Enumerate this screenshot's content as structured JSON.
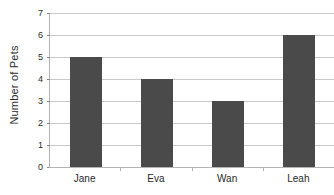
{
  "chart_data": {
    "type": "bar",
    "title": "",
    "xlabel": "",
    "ylabel": "Number of Pets",
    "categories": [
      "Jane",
      "Eva",
      "Wan",
      "Leah"
    ],
    "values": [
      5,
      4,
      3,
      6
    ],
    "ylim": [
      0,
      7
    ],
    "yticks": [
      0,
      1,
      2,
      3,
      4,
      5,
      6,
      7
    ],
    "ytick_labels": [
      "0",
      "1",
      "2",
      "3",
      "4",
      "5",
      "6",
      "7"
    ],
    "grid": true,
    "legend": "none",
    "series_name": "Number of Pets"
  },
  "style": {
    "bar_color": "#4a4a4a",
    "gridline_color": "#c8c8c8",
    "axis_color": "#b4b4b4",
    "text_color": "#2b2b2b",
    "background": "#ffffff"
  }
}
